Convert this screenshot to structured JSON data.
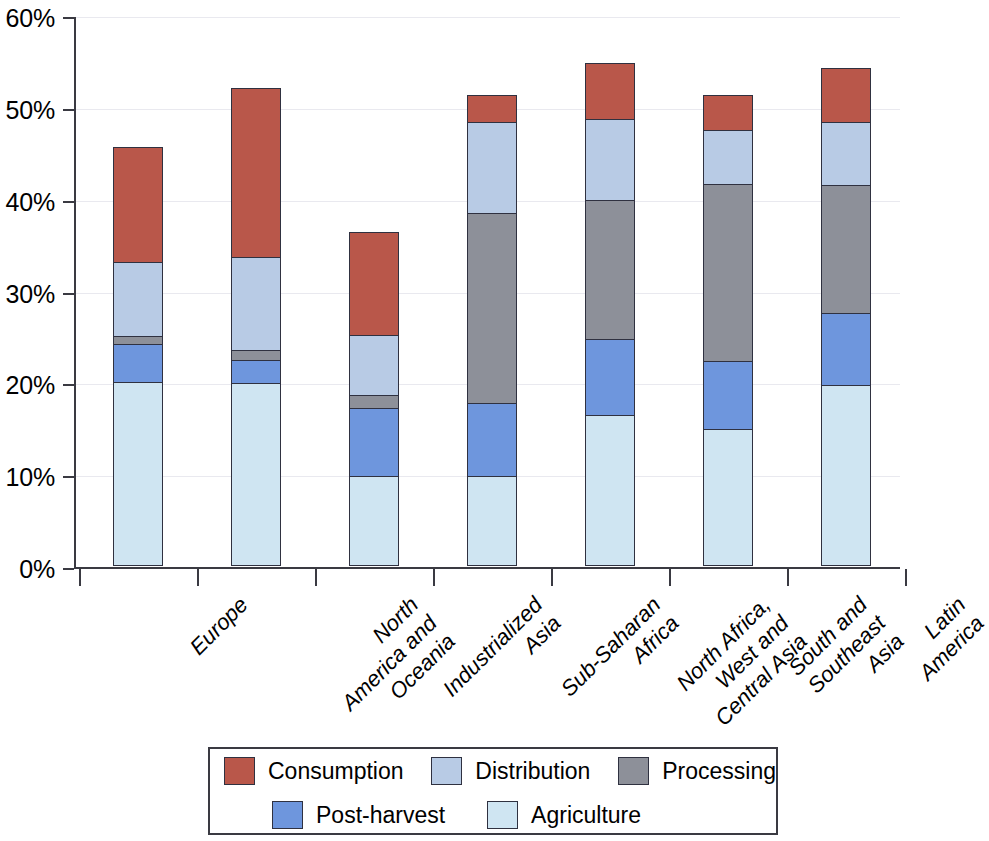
{
  "chart_data": {
    "type": "bar",
    "stacked": true,
    "title": "",
    "xlabel": "",
    "ylabel": "",
    "ylim": [
      0,
      60
    ],
    "ytick_labels": [
      "60%",
      "50%",
      "40%",
      "30%",
      "20%",
      "10%",
      "0%"
    ],
    "ytick_values": [
      60,
      50,
      40,
      30,
      20,
      10,
      0
    ],
    "grid": true,
    "legend_position": "bottom",
    "categories": [
      "Europe",
      "North\nAmerica and\nOceania",
      "Industrialized\nAsia",
      "Sub-Saharan\nAfrica",
      "North Africa,\nWest and\nCentral Asia",
      "South and\nSoutheast\nAsia",
      "Latin\nAmerica"
    ],
    "series": [
      {
        "name": "Agriculture",
        "color": "#cfe5f2",
        "values": [
          20.0,
          19.9,
          9.8,
          9.8,
          16.4,
          14.9,
          19.7
        ]
      },
      {
        "name": "Post-harvest",
        "color": "#6e96dd",
        "values": [
          4.2,
          2.5,
          7.4,
          8.0,
          8.3,
          7.4,
          7.8
        ]
      },
      {
        "name": "Processing",
        "color": "#8d9099",
        "values": [
          0.9,
          1.1,
          1.4,
          20.6,
          15.2,
          19.3,
          14.0
        ]
      },
      {
        "name": "Distribution",
        "color": "#b8cbe5",
        "values": [
          8.0,
          10.2,
          6.6,
          10.0,
          8.8,
          5.9,
          6.9
        ]
      },
      {
        "name": "Consumption",
        "color": "#b9574a",
        "values": [
          12.5,
          18.4,
          11.2,
          2.9,
          6.1,
          3.8,
          5.8
        ]
      }
    ],
    "totals": [
      45.6,
      52.1,
      36.4,
      51.3,
      54.8,
      51.3,
      54.2
    ]
  },
  "legend": {
    "items": [
      {
        "label": "Consumption",
        "color": "#b9574a"
      },
      {
        "label": "Distribution",
        "color": "#b8cbe5"
      },
      {
        "label": "Processing",
        "color": "#8d9099"
      },
      {
        "label": "Post-harvest",
        "color": "#6e96dd"
      },
      {
        "label": "Agriculture",
        "color": "#cfe5f2"
      }
    ]
  }
}
